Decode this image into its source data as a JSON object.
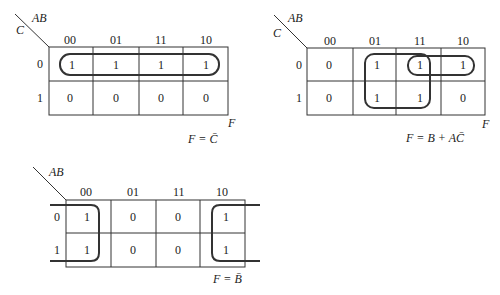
{
  "maps": [
    {
      "id": "map1",
      "row_var": "C",
      "col_var": "AB",
      "col_labels": [
        "00",
        "01",
        "11",
        "10"
      ],
      "row_labels": [
        "0",
        "1"
      ],
      "cells": [
        [
          "1",
          "1",
          "1",
          "1"
        ],
        [
          "0",
          "0",
          "0",
          "0"
        ]
      ],
      "output_label": "F",
      "equation": "F = C̄",
      "groups": [
        "row 0, all four columns"
      ]
    },
    {
      "id": "map2",
      "row_var": "C",
      "col_var": "AB",
      "col_labels": [
        "00",
        "01",
        "11",
        "10"
      ],
      "row_labels": [
        "0",
        "1"
      ],
      "cells": [
        [
          "0",
          "1",
          "1",
          "1"
        ],
        [
          "0",
          "1",
          "1",
          "0"
        ]
      ],
      "output_label": "F",
      "equation": "F = B + AC̄",
      "groups": [
        "columns 01,11 both rows",
        "row 0, columns 11,10"
      ]
    },
    {
      "id": "map3",
      "row_var": "",
      "col_var": "AB",
      "col_labels": [
        "00",
        "01",
        "11",
        "10"
      ],
      "row_labels": [
        "0",
        "1"
      ],
      "cells": [
        [
          "1",
          "0",
          "0",
          "1"
        ],
        [
          "1",
          "0",
          "0",
          "1"
        ]
      ],
      "output_label": "",
      "equation": "F = B̄",
      "groups": [
        "columns 00 and 10 wrap-around, both rows"
      ]
    }
  ]
}
